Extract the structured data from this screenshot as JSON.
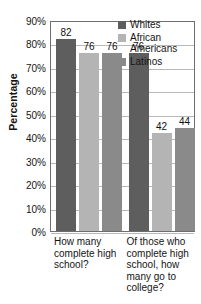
{
  "chart_data": {
    "type": "bar",
    "title": "",
    "xlabel": "",
    "ylabel": "Percentage",
    "ylim": [
      0,
      90
    ],
    "grid": true,
    "legend_position": "top-right",
    "categories": [
      "How many complete high school?",
      "Of those who complete high school, how many go to college?"
    ],
    "series": [
      {
        "name": "Whites",
        "values": [
          82,
          76
        ],
        "color": "#5e5e5e"
      },
      {
        "name": "African Americans",
        "values": [
          76,
          42
        ],
        "color": "#b4b4b4"
      },
      {
        "name": "Latinos",
        "values": [
          76,
          44
        ],
        "color": "#8a8a8a"
      }
    ],
    "y_ticks": [
      "90%",
      "80%",
      "70%",
      "60%",
      "50%",
      "40%",
      "30%",
      "20%",
      "10%",
      "0%"
    ],
    "data_labels": {
      "group1": [
        "82",
        "76",
        "76"
      ],
      "group2": [
        "52",
        "42",
        "44"
      ]
    }
  },
  "axis": {
    "y_title": "Percentage"
  },
  "legend": {
    "entries": [
      {
        "label": "Whites"
      },
      {
        "label": "African Americans"
      },
      {
        "label": "Latinos"
      }
    ]
  },
  "x_labels": [
    "How many complete high school?",
    "Of those who complete high school, how many go to college?"
  ]
}
